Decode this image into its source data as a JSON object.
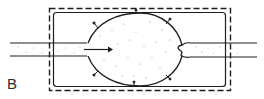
{
  "figure": {
    "panel_label": "B",
    "colors": {
      "stroke": "#1e1e1e",
      "stipple": "#8a8a8a",
      "background": "#ffffff"
    },
    "elements": {
      "outer_boundary": "dashed rectangle",
      "inner_chamber": "solid rounded rectangle",
      "cell_body": "oval with stippled content and radial tick marks",
      "inlet_tube": "left horizontal channel entering through boundary",
      "outlet_tube": "right horizontal channel exiting through boundary",
      "flow_arrow": "rightward arrow inside cell"
    }
  }
}
